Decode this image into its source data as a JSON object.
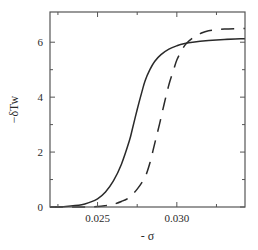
{
  "chart_data": {
    "type": "line",
    "title": "",
    "xlabel": "- σ",
    "ylabel": "−δTw",
    "xlim": [
      0.022,
      0.0343
    ],
    "ylim": [
      0,
      7.1
    ],
    "grid": false,
    "legend": "none",
    "x_ticks": [
      {
        "value": 0.0225,
        "label": ""
      },
      {
        "value": 0.025,
        "label": "0.025"
      },
      {
        "value": 0.0275,
        "label": ""
      },
      {
        "value": 0.03,
        "label": "0.030"
      },
      {
        "value": 0.0325,
        "label": ""
      }
    ],
    "y_ticks": [
      {
        "value": 0,
        "label": "0"
      },
      {
        "value": 1,
        "label": ""
      },
      {
        "value": 2,
        "label": "2"
      },
      {
        "value": 3,
        "label": ""
      },
      {
        "value": 4,
        "label": "4"
      },
      {
        "value": 5,
        "label": ""
      },
      {
        "value": 6,
        "label": "6"
      }
    ],
    "series": [
      {
        "name": "solid",
        "style": "solid",
        "color": "#2a2a2a",
        "x": [
          0.022,
          0.023,
          0.024,
          0.0245,
          0.025,
          0.0255,
          0.026,
          0.0265,
          0.027,
          0.0272,
          0.0275,
          0.0278,
          0.028,
          0.0283,
          0.0286,
          0.029,
          0.0295,
          0.03,
          0.0305,
          0.031,
          0.032,
          0.033,
          0.0343
        ],
        "y": [
          0.0,
          0.02,
          0.08,
          0.17,
          0.3,
          0.55,
          0.95,
          1.55,
          2.4,
          2.85,
          3.55,
          4.2,
          4.6,
          5.0,
          5.3,
          5.55,
          5.75,
          5.87,
          5.95,
          6.0,
          6.06,
          6.1,
          6.13
        ]
      },
      {
        "name": "dashed",
        "style": "dashed",
        "color": "#2a2a2a",
        "x": [
          0.022,
          0.024,
          0.025,
          0.0255,
          0.026,
          0.0265,
          0.027,
          0.0275,
          0.028,
          0.0283,
          0.0286,
          0.0289,
          0.0292,
          0.0295,
          0.0298,
          0.03,
          0.0303,
          0.0306,
          0.031,
          0.0315,
          0.032,
          0.033,
          0.0343
        ],
        "y": [
          0.0,
          0.0,
          0.02,
          0.05,
          0.1,
          0.2,
          0.35,
          0.65,
          1.1,
          1.6,
          2.3,
          3.0,
          3.75,
          4.45,
          5.0,
          5.35,
          5.7,
          5.95,
          6.15,
          6.32,
          6.42,
          6.48,
          6.5
        ]
      }
    ]
  }
}
